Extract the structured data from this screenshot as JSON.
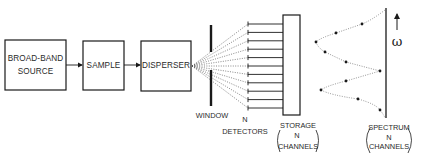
{
  "diagram": {
    "type": "block-diagram",
    "blocks": [
      {
        "id": "source",
        "lines": [
          "BROAD-BAND",
          "SOURCE"
        ]
      },
      {
        "id": "sample",
        "lines": [
          "SAMPLE"
        ]
      },
      {
        "id": "disperser",
        "lines": [
          "DISPERSER"
        ]
      }
    ],
    "window": {
      "label": "WINDOW"
    },
    "detectors": {
      "label_lines": [
        "N",
        "DETECTORS"
      ],
      "count": 11
    },
    "storage": {
      "label_lines": [
        "STORAGE",
        "N",
        "CHANNELS"
      ]
    },
    "spectrum": {
      "label_lines": [
        "SPECTRUM",
        "N",
        "CHANNELS"
      ],
      "axis_symbol": "ω",
      "points": [
        [
          362,
          24
        ],
        [
          336,
          33
        ],
        [
          316,
          42
        ],
        [
          325,
          52
        ],
        [
          346,
          62
        ],
        [
          380,
          71
        ],
        [
          346,
          81
        ],
        [
          321,
          90
        ],
        [
          358,
          99
        ],
        [
          380,
          110
        ]
      ]
    },
    "colors": {
      "ink": "#1a1a1a",
      "dotted": "#555555",
      "background": "#ffffff"
    }
  }
}
